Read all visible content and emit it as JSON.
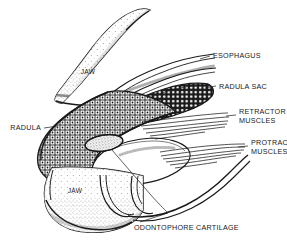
{
  "figure": {
    "background_color": "#ffffff",
    "ink_color": "#1a1a1a"
  },
  "labels": {
    "esophagus": "ESOPHAGUS",
    "radula_sac": "RADULA SAC",
    "retractor_muscles_line1": "RETRACTOR",
    "retractor_muscles_line2": "MUSCLES",
    "protractor_muscles_line1": "PROTRACTOR",
    "protractor_muscles_line2": "MUSCLES",
    "radula": "RADULA",
    "odontophore_cartilage": "ODONTOPHORE CARTILAGE",
    "jaw_upper": "JAW",
    "jaw_lower": "JAW"
  },
  "structures": [
    {
      "name": "upper-jaw",
      "label": "JAW",
      "shading": "stipple"
    },
    {
      "name": "lower-jaw",
      "label": "JAW",
      "shading": "stipple"
    },
    {
      "name": "esophagus",
      "label": "ESOPHAGUS",
      "shading": "line"
    },
    {
      "name": "radula-sac",
      "label": "RADULA SAC",
      "shading": "dense-texture"
    },
    {
      "name": "radula-ribbon",
      "label": "RADULA",
      "shading": "cross-hatch"
    },
    {
      "name": "retractor-muscles",
      "label": "RETRACTOR MUSCLES",
      "shading": "fiber-bundle"
    },
    {
      "name": "protractor-muscles",
      "label": "PROTRACTOR MUSCLES",
      "shading": "fiber-bundle"
    },
    {
      "name": "odontophore-cartilage",
      "label": "ODONTOPHORE CARTILAGE",
      "shading": "stipple"
    }
  ]
}
